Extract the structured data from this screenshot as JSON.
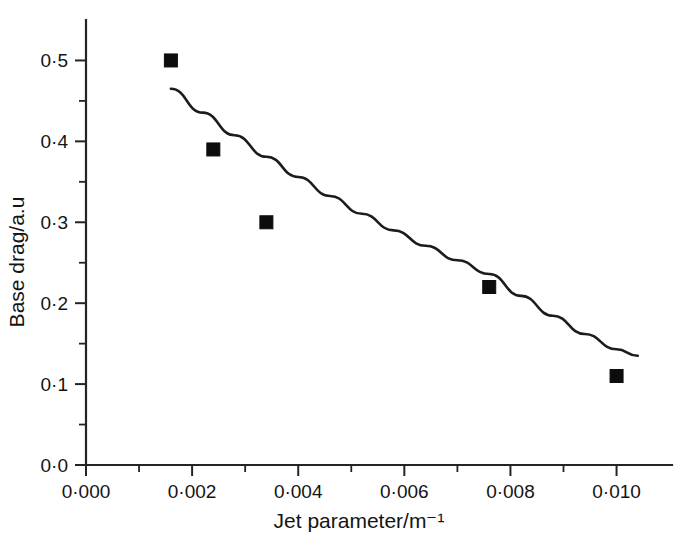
{
  "chart_data": {
    "type": "scatter",
    "title": "",
    "subtitle": "",
    "xlabel": "Jet parameter/m⁻¹",
    "ylabel": "Base drag/a.u",
    "xlim": [
      0.0,
      0.0108
    ],
    "ylim": [
      0.0,
      0.55
    ],
    "grid": false,
    "legend": null,
    "legend_position": "none",
    "x_ticks": [
      {
        "value": 0.0,
        "label": "0·000"
      },
      {
        "value": 0.002,
        "label": "0·002"
      },
      {
        "value": 0.004,
        "label": "0·004"
      },
      {
        "value": 0.006,
        "label": "0·006"
      },
      {
        "value": 0.008,
        "label": "0·008"
      },
      {
        "value": 0.01,
        "label": "0·010"
      }
    ],
    "x_minor_ticks": [
      0.001,
      0.003,
      0.005,
      0.007,
      0.009
    ],
    "y_ticks": [
      {
        "value": 0.0,
        "label": "0·0"
      },
      {
        "value": 0.1,
        "label": "0·1"
      },
      {
        "value": 0.2,
        "label": "0·2"
      },
      {
        "value": 0.3,
        "label": "0·3"
      },
      {
        "value": 0.4,
        "label": "0·4"
      },
      {
        "value": 0.5,
        "label": "0·5"
      }
    ],
    "y_minor_ticks": [
      0.05,
      0.15,
      0.25,
      0.35,
      0.45
    ],
    "series": [
      {
        "name": "Measured base drag",
        "type": "scatter",
        "marker": "square",
        "marker_size": 13,
        "color": "#0d0d0d",
        "points": [
          {
            "x": 0.0016,
            "y": 0.5
          },
          {
            "x": 0.0024,
            "y": 0.39
          },
          {
            "x": 0.0034,
            "y": 0.3
          },
          {
            "x": 0.0076,
            "y": 0.22
          },
          {
            "x": 0.01,
            "y": 0.11
          }
        ]
      },
      {
        "name": "Fitted trend curve",
        "type": "line",
        "color": "#1c1c1c",
        "points": [
          {
            "x": 0.0016,
            "y": 0.465
          },
          {
            "x": 0.0022,
            "y": 0.4355
          },
          {
            "x": 0.0028,
            "y": 0.4075
          },
          {
            "x": 0.0034,
            "y": 0.381
          },
          {
            "x": 0.004,
            "y": 0.356
          },
          {
            "x": 0.0046,
            "y": 0.3325
          },
          {
            "x": 0.0052,
            "y": 0.3105
          },
          {
            "x": 0.0058,
            "y": 0.29
          },
          {
            "x": 0.0064,
            "y": 0.271
          },
          {
            "x": 0.007,
            "y": 0.253
          },
          {
            "x": 0.0076,
            "y": 0.236
          },
          {
            "x": 0.0082,
            "y": 0.209
          },
          {
            "x": 0.0088,
            "y": 0.1845
          },
          {
            "x": 0.0094,
            "y": 0.162
          },
          {
            "x": 0.01,
            "y": 0.143
          },
          {
            "x": 0.0104,
            "y": 0.135
          }
        ]
      }
    ]
  },
  "figure": {
    "background_color": "#ffffff",
    "axis_color": "#242424",
    "text_color": "#141414"
  }
}
